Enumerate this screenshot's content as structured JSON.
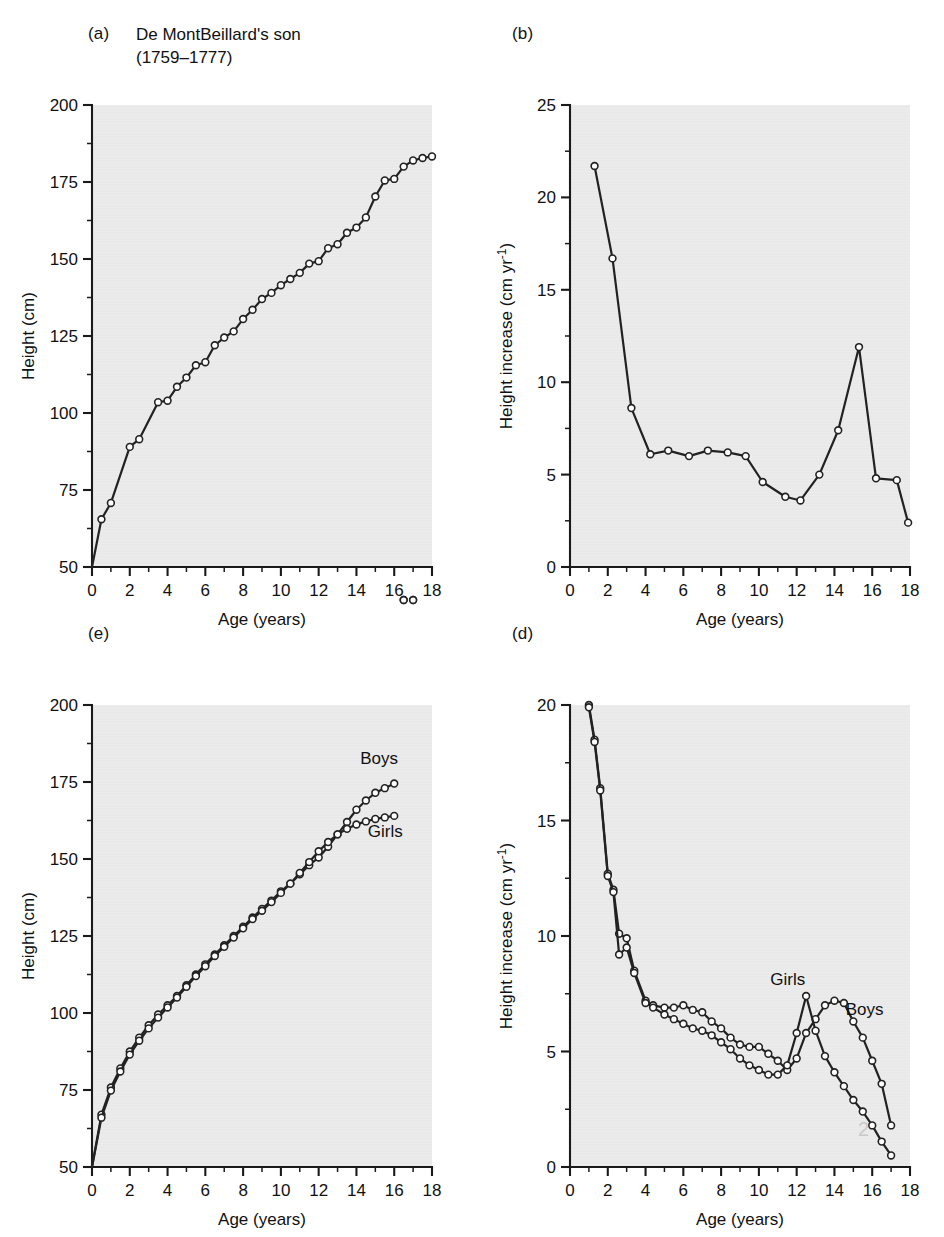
{
  "figure": {
    "background": "#ffffff",
    "plot_background": "#ececec",
    "ink": "#222222",
    "panels": [
      "a",
      "b",
      "e",
      "d"
    ]
  },
  "panel_a": {
    "label": "(a)",
    "title": "De MontBeillard's son\n(1759–1777)",
    "chart_data": {
      "type": "line",
      "title": "De MontBeillard's son (1759–1777)",
      "xlabel": "Age (years)",
      "ylabel": "Height (cm)",
      "xlim": [
        0,
        18
      ],
      "ylim": [
        50,
        200
      ],
      "xticks": [
        0,
        2,
        4,
        6,
        8,
        10,
        12,
        14,
        16,
        18
      ],
      "yticks": [
        50,
        75,
        100,
        125,
        150,
        175,
        200
      ],
      "xminor_step": 1,
      "yminor_step": 12.5,
      "grid": false,
      "legend": "none",
      "markers": "open-circle",
      "series": [
        {
          "name": "De MontBeillard's son height",
          "x": [
            0,
            0.5,
            1.0,
            2.0,
            2.5,
            3.5,
            4.0,
            4.5,
            5.0,
            5.5,
            6.0,
            6.5,
            7.0,
            7.5,
            8.0,
            8.5,
            9.0,
            9.5,
            10.0,
            10.5,
            11.0,
            11.5,
            12.0,
            12.5,
            13.0,
            13.5,
            14.0,
            14.5,
            15.0,
            15.5,
            16.0,
            16.5,
            17.0,
            17.5,
            18.0
          ],
          "values": [
            50.0,
            65.5,
            70.8,
            89.0,
            91.5,
            103.5,
            104.0,
            108.5,
            111.5,
            115.5,
            116.5,
            122.0,
            124.5,
            126.5,
            130.5,
            133.5,
            137.0,
            139.0,
            141.5,
            143.5,
            145.5,
            148.5,
            149.3,
            153.5,
            154.8,
            158.5,
            160.2,
            163.5,
            170.3,
            175.5,
            176.0,
            180.0,
            182.0,
            182.8,
            183.3
          ]
        }
      ]
    }
  },
  "panel_b": {
    "label": "(b)",
    "chart_data": {
      "type": "line",
      "title": "",
      "xlabel": "Age (years)",
      "ylabel": "Height increase (cm yr⁻¹)",
      "xlim": [
        0,
        18
      ],
      "ylim": [
        0,
        25
      ],
      "xticks": [
        0,
        2,
        4,
        6,
        8,
        10,
        12,
        14,
        16,
        18
      ],
      "yticks": [
        0,
        5,
        10,
        15,
        20,
        25
      ],
      "xminor_step": 1,
      "yminor_step": 2.5,
      "grid": false,
      "legend": "none",
      "markers": "open-circle",
      "series": [
        {
          "name": "Annual height increment",
          "x": [
            1.3,
            2.25,
            3.25,
            4.25,
            5.2,
            6.3,
            7.3,
            8.35,
            9.3,
            10.2,
            11.4,
            12.2,
            13.2,
            14.2,
            15.3,
            16.2,
            17.3,
            17.9
          ],
          "values": [
            21.7,
            16.7,
            8.6,
            6.1,
            6.3,
            6.0,
            6.3,
            6.2,
            6.0,
            4.6,
            3.8,
            3.6,
            5.0,
            7.4,
            11.9,
            4.8,
            4.7,
            2.4
          ]
        }
      ]
    }
  },
  "panel_e": {
    "label": "(e)",
    "series_labels": {
      "boys": "Boys",
      "girls": "Girls"
    },
    "chart_data": {
      "type": "line",
      "title": "",
      "xlabel": "Age (years)",
      "ylabel": "Height (cm)",
      "xlim": [
        0,
        18
      ],
      "ylim": [
        50,
        200
      ],
      "xticks": [
        0,
        2,
        4,
        6,
        8,
        10,
        12,
        14,
        16,
        18
      ],
      "yticks": [
        50,
        75,
        100,
        125,
        150,
        175,
        200
      ],
      "xminor_step": 1,
      "yminor_step": 12.5,
      "grid": false,
      "legend": "inline-labels",
      "markers": "open-circle",
      "series": [
        {
          "name": "Boys",
          "x": [
            0,
            0.5,
            1.0,
            1.5,
            2.0,
            2.5,
            3.0,
            3.5,
            4.0,
            4.5,
            5.0,
            5.5,
            6.0,
            6.5,
            7.0,
            7.5,
            8.0,
            8.5,
            9.0,
            9.5,
            10.0,
            10.5,
            11.0,
            11.5,
            12.0,
            12.5,
            13.0,
            13.5,
            14.0,
            14.5,
            15.0,
            15.5,
            16.0,
            16.5,
            17.0
          ],
          "values": [
            50.0,
            67.0,
            75.8,
            82.0,
            87.5,
            92.0,
            96.0,
            99.5,
            102.5,
            105.5,
            109.0,
            112.5,
            115.8,
            119.0,
            122.0,
            125.0,
            128.0,
            131.0,
            133.8,
            136.5,
            139.5,
            142.0,
            145.0,
            148.0,
            150.5,
            154.0,
            158.0,
            162.0,
            166.0,
            169.0,
            171.5,
            173.0,
            174.5
          ]
        },
        {
          "name": "Girls",
          "x": [
            0,
            0.5,
            1.0,
            1.5,
            2.0,
            2.5,
            3.0,
            3.5,
            4.0,
            4.5,
            5.0,
            5.5,
            6.0,
            6.5,
            7.0,
            7.5,
            8.0,
            8.5,
            9.0,
            9.5,
            10.0,
            10.5,
            11.0,
            11.5,
            12.0,
            12.5,
            13.0,
            13.5,
            14.0,
            14.5,
            15.0,
            15.5,
            16.0,
            16.5,
            17.0
          ],
          "values": [
            50.0,
            66.0,
            74.8,
            81.0,
            86.5,
            91.0,
            95.0,
            98.5,
            101.8,
            105.0,
            108.5,
            112.0,
            115.2,
            118.5,
            121.5,
            124.5,
            127.5,
            130.5,
            133.2,
            136.0,
            139.0,
            142.0,
            145.5,
            149.0,
            152.5,
            155.5,
            158.0,
            159.8,
            161.2,
            162.2,
            163.0,
            163.5,
            164.0
          ]
        }
      ]
    }
  },
  "panel_d": {
    "label": "(d)",
    "series_labels": {
      "boys": "Boys",
      "girls": "Girls"
    },
    "chart_data": {
      "type": "line",
      "title": "",
      "xlabel": "Age (years)",
      "ylabel": "Height increase (cm yr⁻¹)",
      "xlim": [
        0,
        18
      ],
      "ylim": [
        0,
        20
      ],
      "xticks": [
        0,
        2,
        4,
        6,
        8,
        10,
        12,
        14,
        16,
        18
      ],
      "yticks": [
        0,
        5,
        10,
        15,
        20
      ],
      "xminor_step": 1,
      "yminor_step": 2.5,
      "grid": false,
      "legend": "inline-labels",
      "markers": "open-circle",
      "series": [
        {
          "name": "Boys",
          "x": [
            1.0,
            1.3,
            1.6,
            2.0,
            2.3,
            2.6,
            3.0,
            3.4,
            4.0,
            4.4,
            5.0,
            5.5,
            6.0,
            6.5,
            7.0,
            7.5,
            8.0,
            8.5,
            9.0,
            9.5,
            10.0,
            10.5,
            11.0,
            11.5,
            12.0,
            12.5,
            13.0,
            13.5,
            14.0,
            14.5,
            15.0,
            15.5,
            16.0,
            16.5,
            17.0
          ],
          "values": [
            20.0,
            18.5,
            16.4,
            12.7,
            12.0,
            10.1,
            9.9,
            8.5,
            7.2,
            7.0,
            6.9,
            6.9,
            7.0,
            6.8,
            6.7,
            6.3,
            6.0,
            5.6,
            5.3,
            5.2,
            5.2,
            4.9,
            4.6,
            4.2,
            4.7,
            5.8,
            6.4,
            7.0,
            7.2,
            7.1,
            6.3,
            5.6,
            4.6,
            3.6,
            1.8
          ]
        },
        {
          "name": "Girls",
          "x": [
            1.0,
            1.3,
            1.6,
            2.0,
            2.3,
            2.6,
            3.0,
            3.4,
            4.0,
            4.4,
            5.0,
            5.5,
            6.0,
            6.5,
            7.0,
            7.5,
            8.0,
            8.5,
            9.0,
            9.5,
            10.0,
            10.5,
            11.0,
            11.5,
            12.0,
            12.5,
            13.0,
            13.5,
            14.0,
            14.5,
            15.0,
            15.5,
            16.0,
            16.5,
            17.0
          ],
          "values": [
            19.9,
            18.4,
            16.3,
            12.6,
            11.9,
            9.2,
            9.5,
            8.4,
            7.1,
            6.9,
            6.6,
            6.4,
            6.2,
            6.0,
            5.9,
            5.7,
            5.4,
            5.1,
            4.7,
            4.4,
            4.2,
            4.0,
            4.0,
            4.4,
            5.8,
            7.4,
            5.9,
            4.8,
            4.1,
            3.5,
            2.9,
            2.4,
            1.8,
            1.1,
            0.5
          ]
        }
      ]
    }
  },
  "right_caption_fragments": [
    "",
    "",
    "",
    "",
    "",
    "",
    "",
    "",
    "",
    "",
    ""
  ]
}
